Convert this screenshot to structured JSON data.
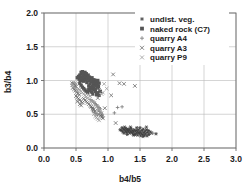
{
  "chart_data": {
    "type": "scatter",
    "title": "",
    "xlabel": "b4/b5",
    "ylabel": "b3/b4",
    "xlim": [
      0.0,
      3.0
    ],
    "ylim": [
      0.0,
      2.0
    ],
    "xticks": [
      "0.0",
      "0.5",
      "1.0",
      "1.5",
      "2.0",
      "2.5",
      "3.0"
    ],
    "yticks": [
      "0.0",
      "0.5",
      "1.0",
      "1.5",
      "2.0"
    ],
    "xtick_values": [
      0.0,
      0.5,
      1.0,
      1.5,
      2.0,
      2.5,
      3.0
    ],
    "ytick_values": [
      0.0,
      0.5,
      1.0,
      1.5,
      2.0
    ],
    "grid": true,
    "legend_position": "upper right",
    "series": [
      {
        "name": "undist. veg.",
        "marker": "asterisk",
        "color": "#3d3d3d",
        "points": [
          [
            1.19,
            0.27
          ],
          [
            1.21,
            0.26
          ],
          [
            1.22,
            0.3
          ],
          [
            1.23,
            0.24
          ],
          [
            1.24,
            0.28
          ],
          [
            1.25,
            0.22
          ],
          [
            1.26,
            0.27
          ],
          [
            1.27,
            0.25
          ],
          [
            1.28,
            0.29
          ],
          [
            1.29,
            0.23
          ],
          [
            1.3,
            0.26
          ],
          [
            1.31,
            0.28
          ],
          [
            1.32,
            0.24
          ],
          [
            1.33,
            0.27
          ],
          [
            1.34,
            0.22
          ],
          [
            1.35,
            0.25
          ],
          [
            1.36,
            0.29
          ],
          [
            1.37,
            0.23
          ],
          [
            1.38,
            0.26
          ],
          [
            1.39,
            0.21
          ],
          [
            1.4,
            0.24
          ],
          [
            1.41,
            0.27
          ],
          [
            1.42,
            0.2
          ],
          [
            1.43,
            0.25
          ],
          [
            1.44,
            0.22
          ],
          [
            1.45,
            0.26
          ],
          [
            1.46,
            0.19
          ],
          [
            1.47,
            0.23
          ],
          [
            1.48,
            0.27
          ],
          [
            1.49,
            0.21
          ],
          [
            1.5,
            0.24
          ],
          [
            1.51,
            0.18
          ],
          [
            1.52,
            0.22
          ],
          [
            1.53,
            0.26
          ],
          [
            1.54,
            0.2
          ],
          [
            1.55,
            0.28
          ],
          [
            1.56,
            0.23
          ],
          [
            1.57,
            0.19
          ],
          [
            1.58,
            0.25
          ],
          [
            1.59,
            0.21
          ],
          [
            1.6,
            0.27
          ],
          [
            1.61,
            0.18
          ],
          [
            1.62,
            0.23
          ],
          [
            1.63,
            0.26
          ],
          [
            1.64,
            0.2
          ],
          [
            1.66,
            0.24
          ],
          [
            1.68,
            0.22
          ],
          [
            1.75,
            0.21
          ],
          [
            1.26,
            0.31
          ],
          [
            1.3,
            0.2
          ],
          [
            1.35,
            0.31
          ],
          [
            1.4,
            0.19
          ],
          [
            1.45,
            0.3
          ],
          [
            1.5,
            0.3
          ],
          [
            1.55,
            0.17
          ],
          [
            1.6,
            0.31
          ]
        ]
      },
      {
        "name": "naked rock (C7)",
        "marker": "square",
        "color": "#555555",
        "points": [
          [
            0.52,
            1.04
          ],
          [
            0.54,
            1.06
          ],
          [
            0.55,
            1.02
          ],
          [
            0.56,
            1.08
          ],
          [
            0.57,
            1.0
          ],
          [
            0.58,
            1.05
          ],
          [
            0.59,
            1.1
          ],
          [
            0.6,
            1.03
          ],
          [
            0.61,
            1.07
          ],
          [
            0.62,
            0.99
          ],
          [
            0.63,
            1.04
          ],
          [
            0.64,
            1.09
          ],
          [
            0.65,
            1.01
          ],
          [
            0.66,
            1.06
          ],
          [
            0.67,
            0.97
          ],
          [
            0.68,
            1.03
          ],
          [
            0.69,
            1.08
          ],
          [
            0.7,
            1.0
          ],
          [
            0.71,
            1.05
          ],
          [
            0.72,
            0.95
          ],
          [
            0.73,
            1.02
          ],
          [
            0.74,
            0.98
          ],
          [
            0.75,
            1.04
          ],
          [
            0.76,
            1.0
          ],
          [
            0.77,
            0.94
          ],
          [
            0.78,
            1.01
          ],
          [
            0.79,
            0.97
          ],
          [
            0.8,
            1.0
          ],
          [
            0.81,
            0.93
          ],
          [
            0.82,
            0.98
          ],
          [
            0.83,
            0.95
          ],
          [
            0.84,
            1.0
          ],
          [
            0.85,
            0.91
          ],
          [
            0.86,
            0.96
          ],
          [
            0.58,
            1.12
          ],
          [
            0.6,
            1.13
          ],
          [
            0.62,
            1.11
          ],
          [
            0.64,
            1.12
          ],
          [
            0.66,
            1.1
          ],
          [
            0.56,
            0.96
          ],
          [
            0.58,
            0.93
          ],
          [
            0.6,
            0.9
          ],
          [
            0.62,
            0.88
          ],
          [
            0.64,
            0.86
          ],
          [
            0.66,
            0.84
          ],
          [
            0.68,
            0.82
          ],
          [
            0.7,
            0.87
          ],
          [
            0.72,
            0.85
          ],
          [
            0.74,
            0.83
          ],
          [
            0.76,
            0.8
          ],
          [
            0.78,
            0.86
          ],
          [
            0.8,
            0.84
          ],
          [
            0.82,
            0.79
          ],
          [
            0.84,
            0.82
          ],
          [
            0.86,
            0.78
          ],
          [
            0.88,
            0.84
          ],
          [
            0.7,
            0.92
          ],
          [
            0.72,
            0.9
          ],
          [
            0.74,
            0.88
          ],
          [
            0.76,
            0.91
          ],
          [
            0.78,
            0.89
          ],
          [
            0.8,
            0.87
          ],
          [
            0.82,
            0.92
          ],
          [
            0.84,
            0.89
          ]
        ]
      },
      {
        "name": "quarry A4",
        "marker": "plus",
        "color": "#7a7a7a",
        "points": [
          [
            0.72,
            0.72
          ],
          [
            0.75,
            0.7
          ],
          [
            0.78,
            0.68
          ],
          [
            0.8,
            0.66
          ],
          [
            0.82,
            0.64
          ],
          [
            0.84,
            0.62
          ],
          [
            0.86,
            0.6
          ],
          [
            0.88,
            0.58
          ],
          [
            0.76,
            0.55
          ],
          [
            0.79,
            0.53
          ],
          [
            0.81,
            0.51
          ],
          [
            0.83,
            0.49
          ],
          [
            0.85,
            0.56
          ],
          [
            0.87,
            0.54
          ],
          [
            0.89,
            0.52
          ],
          [
            0.91,
            0.5
          ],
          [
            1.15,
            0.6
          ],
          [
            1.22,
            0.61
          ],
          [
            1.1,
            0.52
          ],
          [
            1.7,
            0.22
          ],
          [
            0.74,
            0.6
          ],
          [
            0.77,
            0.58
          ],
          [
            0.9,
            0.48
          ],
          [
            0.92,
            0.46
          ]
        ]
      },
      {
        "name": "quarry A3",
        "marker": "cross",
        "color": "#6a6a6a",
        "points": [
          [
            0.44,
            0.96
          ],
          [
            0.46,
            0.95
          ],
          [
            0.47,
            0.94
          ],
          [
            0.48,
            0.93
          ],
          [
            0.49,
            0.92
          ],
          [
            0.5,
            0.91
          ],
          [
            0.45,
            0.89
          ],
          [
            0.47,
            0.87
          ],
          [
            0.49,
            0.85
          ],
          [
            0.51,
            0.83
          ],
          [
            0.53,
            0.81
          ],
          [
            0.55,
            0.79
          ],
          [
            0.5,
            0.77
          ],
          [
            0.52,
            0.75
          ],
          [
            0.54,
            0.73
          ],
          [
            0.56,
            0.71
          ],
          [
            0.58,
            0.69
          ],
          [
            0.6,
            0.67
          ],
          [
            0.62,
            0.73
          ],
          [
            0.64,
            0.71
          ],
          [
            0.66,
            0.69
          ],
          [
            0.68,
            0.67
          ],
          [
            0.7,
            0.65
          ],
          [
            0.72,
            0.63
          ],
          [
            0.74,
            0.61
          ],
          [
            0.76,
            0.59
          ],
          [
            0.78,
            0.57
          ],
          [
            0.8,
            0.55
          ],
          [
            0.86,
            0.5
          ],
          [
            0.88,
            0.48
          ],
          [
            0.9,
            0.46
          ],
          [
            0.92,
            0.44
          ],
          [
            1.08,
            1.09
          ],
          [
            1.18,
            0.96
          ],
          [
            1.25,
            0.95
          ],
          [
            1.42,
            0.92
          ],
          [
            1.12,
            0.37
          ],
          [
            0.95,
            0.59
          ],
          [
            1.05,
            0.78
          ],
          [
            0.86,
            0.86
          ],
          [
            0.84,
            0.74
          ],
          [
            0.58,
            0.63
          ],
          [
            0.56,
            0.65
          ],
          [
            0.52,
            0.69
          ]
        ]
      },
      {
        "name": "quarry P9",
        "marker": "cross",
        "color": "#9a9a9a",
        "points": [
          [
            0.46,
            0.97
          ],
          [
            0.48,
            0.96
          ],
          [
            0.5,
            0.95
          ],
          [
            0.44,
            0.93
          ],
          [
            0.46,
            0.91
          ],
          [
            0.48,
            0.89
          ],
          [
            0.5,
            0.87
          ],
          [
            0.52,
            0.85
          ],
          [
            0.54,
            0.88
          ],
          [
            0.56,
            0.86
          ],
          [
            0.58,
            0.84
          ],
          [
            0.6,
            0.82
          ],
          [
            0.62,
            0.8
          ],
          [
            0.64,
            0.78
          ],
          [
            0.66,
            0.76
          ],
          [
            0.68,
            0.74
          ],
          [
            0.7,
            0.79
          ],
          [
            0.72,
            0.77
          ],
          [
            0.74,
            0.7
          ],
          [
            0.76,
            0.68
          ],
          [
            0.78,
            0.66
          ],
          [
            0.8,
            0.64
          ],
          [
            0.82,
            0.62
          ],
          [
            0.84,
            0.58
          ],
          [
            0.86,
            0.56
          ],
          [
            0.88,
            0.54
          ],
          [
            0.9,
            0.52
          ],
          [
            0.8,
            0.47
          ],
          [
            0.82,
            0.45
          ],
          [
            0.84,
            0.43
          ],
          [
            0.86,
            0.41
          ],
          [
            0.78,
            0.5
          ],
          [
            0.94,
            0.95
          ],
          [
            0.98,
            0.88
          ],
          [
            0.92,
            0.82
          ],
          [
            0.9,
            0.8
          ]
        ]
      }
    ]
  },
  "legend": {
    "entries": [
      {
        "label": "undist. veg."
      },
      {
        "label": "naked rock (C7)"
      },
      {
        "label": "quarry A4"
      },
      {
        "label": "quarry A3"
      },
      {
        "label": "quarry P9"
      }
    ]
  },
  "colors": {
    "grid": "#b8b8b8",
    "frame": "#6a6a6a",
    "text": "#1a1a1a",
    "background": "#ffffff"
  }
}
